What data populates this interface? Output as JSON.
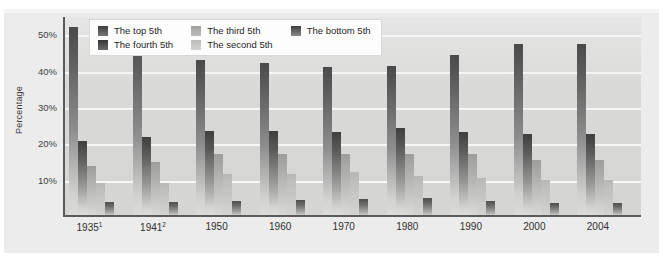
{
  "chart_data": {
    "type": "bar",
    "title": "",
    "subtitle": "",
    "xlabel": "",
    "ylabel": "Percentage",
    "ylim": [
      0,
      55
    ],
    "yticks": [
      10,
      20,
      30,
      40,
      50
    ],
    "ytick_labels": [
      "10%",
      "20%",
      "30%",
      "40%",
      "50%"
    ],
    "grid": true,
    "legend_position": "top-inside",
    "categories": [
      "1935",
      "1941",
      "1950",
      "1960",
      "1970",
      "1980",
      "1990",
      "2000",
      "2004"
    ],
    "category_labels": [
      "1935¹",
      "1941²",
      "1950",
      "1960",
      "1970",
      "1980",
      "1990",
      "2000",
      "2004"
    ],
    "category_footnotes": [
      "1",
      "2",
      "",
      "",
      "",
      "",
      "",
      "",
      ""
    ],
    "series": [
      {
        "name": "The top 5th",
        "values": [
          51.7,
          49.0,
          42.7,
          41.8,
          40.6,
          41.0,
          44.0,
          47.0,
          47.0
        ]
      },
      {
        "name": "The fourth 5th",
        "values": [
          20.4,
          21.5,
          23.0,
          23.0,
          22.8,
          23.8,
          22.9,
          22.4,
          22.4
        ]
      },
      {
        "name": "The third 5th",
        "values": [
          13.6,
          14.5,
          16.8,
          16.9,
          16.9,
          16.9,
          16.8,
          15.0,
          15.0
        ]
      },
      {
        "name": "The second 5th",
        "values": [
          8.8,
          8.9,
          11.3,
          11.3,
          11.8,
          10.8,
          10.2,
          9.6,
          9.5
        ]
      },
      {
        "name": "The bottom 5th",
        "values": [
          3.7,
          3.6,
          3.9,
          4.0,
          4.4,
          4.6,
          3.9,
          3.4,
          3.4
        ]
      }
    ]
  },
  "legend": {
    "items": [
      {
        "label": "The top 5th",
        "swatch": "s0"
      },
      {
        "label": "The fourth 5th",
        "swatch": "s1"
      },
      {
        "label": "The third 5th",
        "swatch": "s2"
      },
      {
        "label": "The second 5th",
        "swatch": "s3"
      },
      {
        "label": "The bottom 5th",
        "swatch": "s4"
      }
    ]
  },
  "colors": {
    "panel_background": "#ececec",
    "plot_background": "#dcdcdb",
    "gridline": "#f6f6f6",
    "axis": "#5a5a5a",
    "text": "#2f2f2f",
    "legend_background": "#fdfdfd"
  }
}
